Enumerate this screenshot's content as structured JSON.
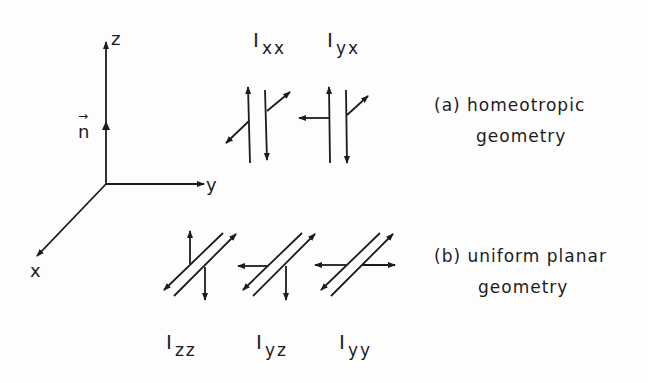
{
  "axes": {
    "z_label": "z",
    "y_label": "y",
    "x_label": "x",
    "director_label": "n",
    "director_arrow": "→"
  },
  "homeotropic": {
    "caption_line1": "(a)  homeotropic",
    "caption_line2": "geometry",
    "intensities": [
      {
        "main": "I",
        "sub": "xx"
      },
      {
        "main": "I",
        "sub": "yx"
      }
    ]
  },
  "planar": {
    "caption_line1": "(b)  uniform  planar",
    "caption_line2": "geometry",
    "intensities": [
      {
        "main": "I",
        "sub": "zz"
      },
      {
        "main": "I",
        "sub": "yz"
      },
      {
        "main": "I",
        "sub": "yy"
      }
    ]
  },
  "colors": {
    "ink": "#1c1c1c",
    "background": "#fdfdfd"
  }
}
